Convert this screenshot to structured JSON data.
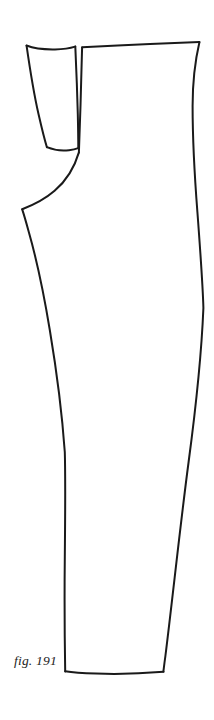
{
  "plate": {
    "name": "trouser-pattern-plate",
    "background_color": "#ffffff",
    "ink_color": "#1a1a1a",
    "width": 214,
    "height": 720
  },
  "caption": {
    "text": "fig. 191",
    "style": "italic",
    "x": 14,
    "y": 665
  },
  "illustration": {
    "subject": "trouser leg pattern piece, side view with fly extension tab",
    "parts": [
      {
        "name": "fly-extension-tab",
        "description": "small narrow rectangle at upper left, slightly tapered",
        "stroke_width": 1.9
      },
      {
        "name": "trouser-body-outline",
        "description": "waistband top edge, side seam right, hem bottom, inseam left, crotch curve",
        "stroke_width": 1.9
      }
    ],
    "segments": [
      {
        "name": "waistband-top-edge",
        "from": [
          82,
          47
        ],
        "to": [
          199,
          42
        ]
      },
      {
        "name": "side-seam-right-edge",
        "from": [
          199,
          42
        ],
        "to": [
          163,
          672
        ]
      },
      {
        "name": "hem-bottom-edge",
        "from": [
          163,
          672
        ],
        "to": [
          65,
          671
        ]
      },
      {
        "name": "inseam-left-edge",
        "from": [
          65,
          671
        ],
        "to": [
          22,
          209
        ]
      },
      {
        "name": "crotch-curve",
        "from": [
          22,
          209
        ],
        "to": [
          80,
          150
        ]
      },
      {
        "name": "fly-front-edge",
        "from": [
          80,
          150
        ],
        "to": [
          82,
          47
        ]
      },
      {
        "name": "tab-top-edge",
        "from": [
          26,
          46
        ],
        "to": [
          75,
          46
        ]
      },
      {
        "name": "tab-right-edge",
        "from": [
          75,
          46
        ],
        "to": [
          78,
          148
        ]
      },
      {
        "name": "tab-bottom-edge",
        "from": [
          78,
          148
        ],
        "to": [
          47,
          147
        ]
      },
      {
        "name": "tab-left-edge",
        "from": [
          47,
          147
        ],
        "to": [
          26,
          46
        ]
      }
    ]
  }
}
